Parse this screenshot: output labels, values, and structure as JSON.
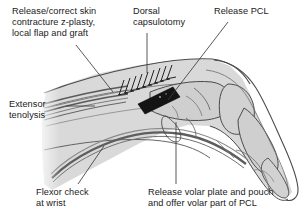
{
  "figure": {
    "labels": {
      "skin_release": "Release/correct skin\ncontracture z-plasty,\nlocal flap and graft",
      "dorsal_capsulotomy": "Dorsal\ncapsulotomy",
      "release_pcl": "Release PCL",
      "extensor_tenolysis": "Extensor\ntenolysis",
      "flexor_check": "Flexor check\nat wrist",
      "volar_plate": "Release volar plate and pouch\nand offer volar part of PCL"
    },
    "colors": {
      "background": "#ffffff",
      "text": "#1a1a1a",
      "leader_line": "#3c3c3c",
      "soft_tissue_fill": "#d6d6d6",
      "soft_tissue_fill_light": "#e4e4e4",
      "bone_fill": "#cccccc",
      "outline": "#4a4a4a",
      "tendon": "#6e6e6e",
      "tendon_dark": "#555555",
      "incision_block": "#141414",
      "suture_hatch": "#2b2b2b"
    },
    "annotations": {
      "dorsal_incision_marker": "black-rectangle-incision-block",
      "suture_marks": "dorsal-capsulotomy-hatching",
      "extensor_tendon": "extensor-tendon-bundle",
      "flexor_tendon": "flexor-tendon-bundle"
    }
  }
}
